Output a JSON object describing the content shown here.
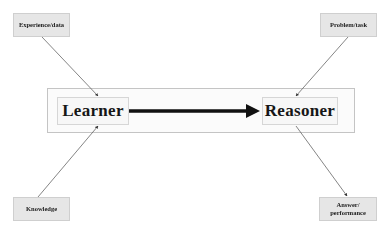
{
  "diagram": {
    "inputs": {
      "top_left": "Experience/data",
      "top_right": "Problem/task",
      "bottom_left": "Knowledge",
      "bottom_right_line1": "Answer/",
      "bottom_right_line2": "performance"
    },
    "core": {
      "learner": "Learner",
      "reasoner": "Reasoner"
    },
    "edges": [
      {
        "from": "Experience/data",
        "to": "Learner"
      },
      {
        "from": "Knowledge",
        "to": "Learner"
      },
      {
        "from": "Learner",
        "to": "Reasoner",
        "style": "thick"
      },
      {
        "from": "Problem/task",
        "to": "Reasoner"
      },
      {
        "from": "Reasoner",
        "to": "Answer/performance"
      }
    ],
    "colors": {
      "box_fill": "#e6e6e6",
      "arrow": "#111111",
      "thin_line": "#555555"
    }
  }
}
